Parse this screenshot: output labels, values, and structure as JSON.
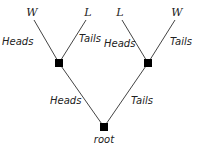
{
  "tree": {
    "root": {
      "label": "root"
    },
    "edges": {
      "root_left": "Heads",
      "root_right": "Tails",
      "left_left": "Heads",
      "left_right": "Tails",
      "right_left": "Heads",
      "right_right": "Tails"
    },
    "leaves": [
      "𝒲",
      "ℒ",
      "ℒ",
      "𝒲"
    ],
    "leaf_names": [
      "W",
      "L",
      "L",
      "W"
    ]
  },
  "colors": {
    "line": "#444444",
    "node": "#000000"
  }
}
